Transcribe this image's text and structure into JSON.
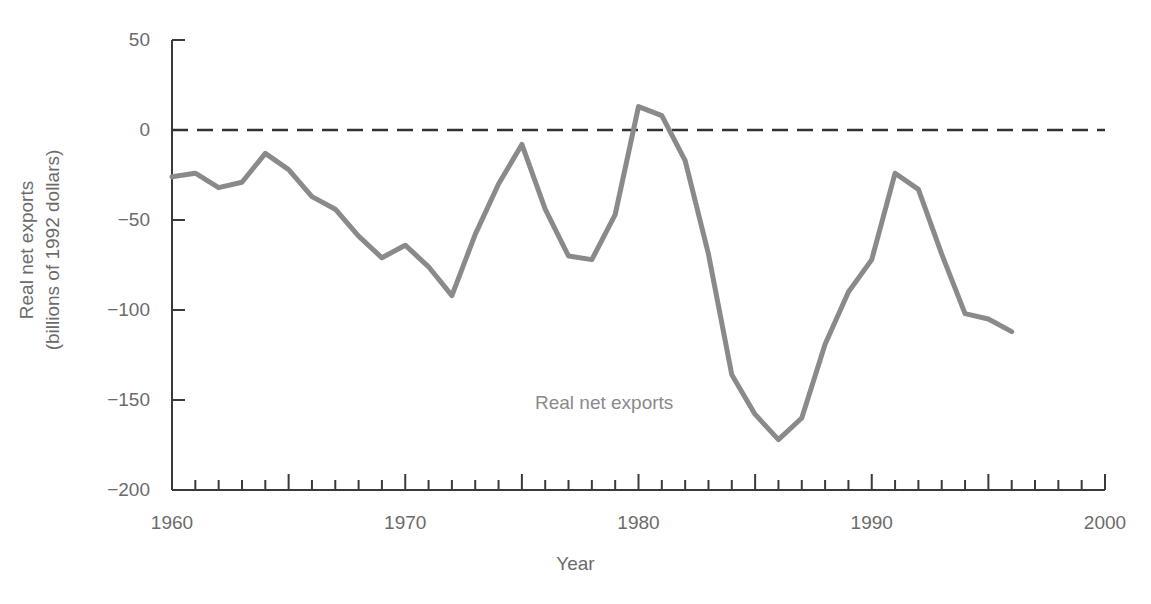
{
  "chart_data": {
    "type": "line",
    "title": "",
    "xlabel": "Year",
    "ylabel": "Real net exports (billions of 1992 dollars)",
    "ylabel_lines": [
      "Real net exports",
      "(billions of 1992 dollars)"
    ],
    "xlim": [
      1960,
      2000
    ],
    "ylim": [
      -200,
      50
    ],
    "xticks": [
      1960,
      1970,
      1980,
      1990,
      2000
    ],
    "xtick_labels": [
      "1960",
      "1970",
      "1980",
      "1990",
      "2000"
    ],
    "xminor_tick_step": 1,
    "yticks": [
      50,
      0,
      -50,
      -100,
      -150,
      -200
    ],
    "ytick_labels": [
      "50",
      "0",
      "−50",
      "−100",
      "−150",
      "−200"
    ],
    "grid": false,
    "legend": "none",
    "annotations": [
      {
        "text": "Real net exports",
        "x": 1977.8,
        "y": -152
      }
    ],
    "reference_lines": [
      {
        "y": 0,
        "style": "dashed",
        "color": "#333333"
      }
    ],
    "line_color": "#8a8a8a",
    "line_width": 5,
    "series": [
      {
        "name": "Real net exports",
        "x": [
          1960,
          1961,
          1962,
          1963,
          1964,
          1965,
          1966,
          1967,
          1968,
          1969,
          1970,
          1971,
          1972,
          1973,
          1974,
          1975,
          1976,
          1977,
          1978,
          1979,
          1980,
          1981,
          1982,
          1983,
          1984,
          1985,
          1986,
          1987,
          1988,
          1989,
          1990,
          1991,
          1992,
          1993,
          1994,
          1995,
          1996
        ],
        "values": [
          -26,
          -24,
          -32,
          -29,
          -13,
          -22,
          -37,
          -44,
          -59,
          -71,
          -64,
          -76,
          -92,
          -58,
          -30,
          -8,
          -44,
          -70,
          -72,
          -47,
          13,
          8,
          -17,
          -69,
          -136,
          -158,
          -172,
          -160,
          -119,
          -90,
          -72,
          -24,
          -33,
          -69,
          -102,
          -105,
          -112
        ]
      }
    ]
  },
  "axis": {
    "y_title_line1": "Real net exports",
    "y_title_line2": "(billions of 1992 dollars)",
    "x_title": "Year"
  }
}
